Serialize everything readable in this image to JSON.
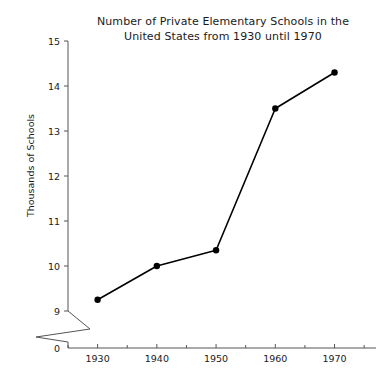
{
  "chart_data": {
    "type": "line",
    "title": "Number of Private Elementary Schools in the United States from 1930 until 1970",
    "title_lines": [
      "Number of Private Elementary Schools in the",
      "United States from 1930 until 1970"
    ],
    "xlabel": "",
    "ylabel": "Thousands of Schools",
    "x": [
      1930,
      1940,
      1950,
      1960,
      1970
    ],
    "categories": [
      "1930",
      "1940",
      "1950",
      "1960",
      "1970"
    ],
    "values": [
      9.25,
      10.0,
      10.35,
      13.5,
      14.3
    ],
    "series": [
      {
        "name": "Private Elementary Schools",
        "values": [
          9.25,
          10.0,
          10.35,
          13.5,
          14.3
        ]
      }
    ],
    "xlim": [
      1925,
      1977
    ],
    "ylim": [
      9,
      15
    ],
    "y_ticks": [
      "9",
      "10",
      "11",
      "12",
      "13",
      "14",
      "15"
    ],
    "y_tick_values": [
      9,
      10,
      11,
      12,
      13,
      14,
      15
    ],
    "y_origin_tick": "0",
    "y_axis_break": true,
    "x_ticks": [
      "1930",
      "1940",
      "1950",
      "1960",
      "1970"
    ],
    "x_tick_values": [
      1930,
      1940,
      1950,
      1960,
      1970
    ],
    "x_minor_tick_values": [
      1925,
      1935,
      1945,
      1955,
      1965,
      1975
    ],
    "grid": false,
    "legend": false,
    "legend_position": "none",
    "marker": "filled-circle",
    "colors": {
      "line": "#000000",
      "marker": "#000000",
      "axis": "#555555",
      "text": "#1a1a1a",
      "background": "#ffffff"
    }
  }
}
